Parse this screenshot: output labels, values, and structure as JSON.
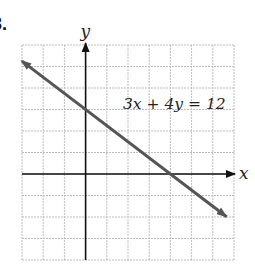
{
  "problem_number": "3.",
  "chart_data": {
    "type": "line",
    "title": "",
    "equation_label": "3x + 4y = 12",
    "xlabel": "x",
    "ylabel": "y",
    "xlim": [
      -3,
      7
    ],
    "ylim": [
      -4,
      6
    ],
    "grid": true,
    "grid_step": 1,
    "tick_labels": false,
    "series": [
      {
        "name": "3x + 4y = 12",
        "equation": "3x + 4y = 12",
        "slope": -0.75,
        "y_intercept": 3,
        "x_intercept": 4,
        "x": [
          -3,
          6.65
        ],
        "y": [
          5.25,
          -1.99
        ],
        "arrows": "both",
        "color": "#555555"
      }
    ]
  },
  "colors": {
    "grid": "#bdbdbd",
    "axis": "#111111",
    "line": "#555555"
  }
}
